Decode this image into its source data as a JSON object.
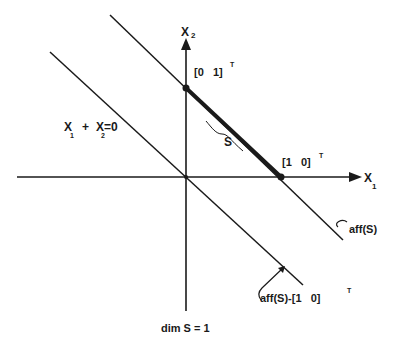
{
  "diagram": {
    "axes": {
      "x1_label": "X",
      "x1_sub": "1",
      "x2_label": "X",
      "x2_sub": "2"
    },
    "points": {
      "p01": "[0   1]",
      "p01_sup": "T",
      "p10": "[1   0]",
      "p10_sup": "T"
    },
    "lines": {
      "origin_line_label_x1": "X",
      "origin_line_sub1": "1",
      "origin_line_plus": "+",
      "origin_line_label_x2": "X",
      "origin_line_sub2": "2",
      "origin_line_eq": "=0",
      "aff_label": "aff(S)",
      "aff_shift_label": "aff(S)-[1   0]",
      "aff_shift_sup": "T"
    },
    "segment_label": "S",
    "caption": "dim S = 1",
    "colors": {
      "ink": "#1a1a1a",
      "background": "#ffffff"
    }
  }
}
